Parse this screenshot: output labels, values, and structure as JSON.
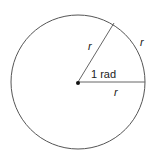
{
  "diagram": {
    "labels": {
      "radius_upper": "r",
      "arc": "r",
      "radius_lower": "r",
      "angle": "1 rad"
    },
    "colors": {
      "stroke": "#555555",
      "text": "#222222",
      "center": "#111111"
    }
  }
}
